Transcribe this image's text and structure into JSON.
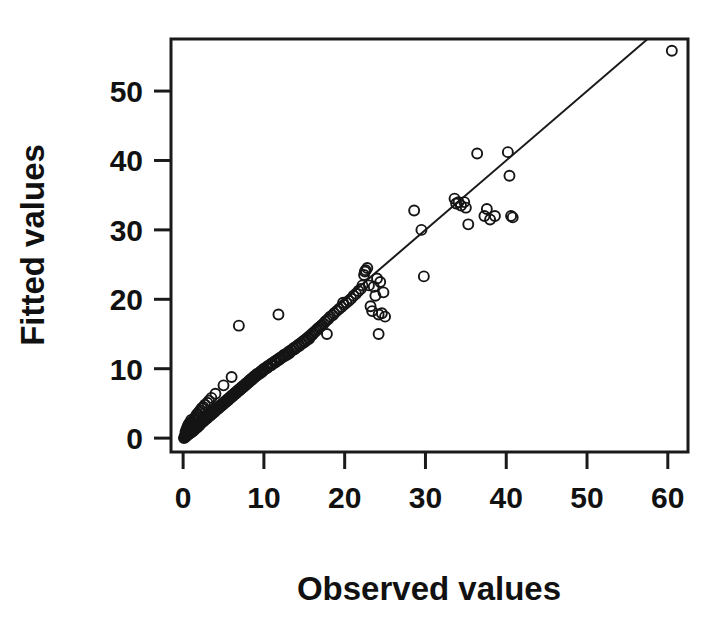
{
  "figure": {
    "background_color": "#ffffff",
    "foreground_color": "#1a1a1a"
  },
  "chart_data": {
    "type": "scatter",
    "title": "",
    "xlabel": "Observed values",
    "ylabel": "Fitted values",
    "xlim": [
      -1.5,
      62.5
    ],
    "ylim": [
      -2.0,
      57.5
    ],
    "xticks": [
      0,
      10,
      20,
      30,
      40,
      50,
      60
    ],
    "yticks": [
      0,
      10,
      20,
      30,
      40,
      50
    ],
    "xticklabels": [
      "0",
      "10",
      "20",
      "30",
      "40",
      "50",
      "60"
    ],
    "yticklabels": [
      "0",
      "10",
      "20",
      "30",
      "40",
      "50"
    ],
    "grid": false,
    "legend": null,
    "marker": {
      "shape": "open-circle",
      "radius_px": 5,
      "stroke": "#151515",
      "stroke_width": 1.9,
      "fill": "none"
    },
    "reference_line": {
      "label": "1:1 identity line",
      "type": "line",
      "slope": 1.0,
      "intercept": 0.0,
      "x_from": 0.0,
      "x_to": 57.5,
      "stroke": "#1a1a1a",
      "stroke_width": 2
    },
    "series": [
      {
        "name": "Observed vs fitted",
        "n_points": 243,
        "x": [
          0.1,
          0.2,
          0.2,
          0.3,
          0.3,
          0.3,
          0.4,
          0.4,
          0.4,
          0.5,
          0.5,
          0.5,
          0.6,
          0.6,
          0.6,
          0.7,
          0.7,
          0.7,
          0.8,
          0.8,
          0.8,
          0.9,
          0.9,
          1.0,
          1.0,
          1.0,
          1.1,
          1.1,
          1.2,
          1.2,
          1.3,
          1.3,
          1.4,
          1.4,
          1.5,
          1.5,
          1.6,
          1.6,
          1.7,
          1.7,
          1.8,
          1.8,
          1.9,
          2.0,
          2.0,
          2.1,
          2.1,
          2.2,
          2.3,
          2.3,
          2.4,
          2.5,
          2.5,
          2.6,
          2.7,
          2.7,
          2.8,
          2.9,
          3.0,
          3.0,
          3.1,
          3.2,
          3.2,
          3.3,
          3.4,
          3.5,
          3.5,
          3.6,
          3.7,
          3.8,
          3.9,
          4.0,
          4.0,
          4.1,
          4.2,
          4.3,
          4.4,
          4.5,
          4.6,
          4.7,
          4.8,
          4.9,
          5.0,
          5.0,
          5.1,
          5.2,
          5.3,
          5.4,
          5.5,
          5.6,
          5.7,
          5.8,
          5.9,
          6.0,
          6.0,
          6.1,
          6.2,
          6.3,
          6.4,
          6.5,
          6.6,
          6.7,
          6.8,
          6.9,
          7.0,
          7.1,
          7.2,
          7.3,
          7.4,
          7.5,
          7.6,
          7.7,
          7.8,
          7.9,
          8.0,
          8.1,
          8.2,
          8.3,
          8.4,
          8.5,
          8.6,
          8.7,
          8.8,
          8.9,
          9.0,
          9.1,
          9.2,
          9.4,
          9.5,
          9.6,
          9.7,
          9.8,
          9.9,
          10.0,
          10.1,
          10.3,
          10.4,
          10.5,
          10.6,
          10.8,
          10.9,
          11.0,
          11.1,
          11.3,
          11.4,
          11.5,
          11.6,
          11.8,
          11.9,
          12.0,
          12.1,
          12.3,
          12.4,
          12.5,
          12.7,
          12.8,
          13.0,
          13.1,
          13.2,
          13.4,
          13.5,
          13.7,
          13.8,
          14.0,
          14.1,
          14.3,
          14.4,
          14.6,
          14.7,
          14.9,
          15.0,
          15.2,
          15.3,
          15.5,
          15.6,
          15.8,
          16.0,
          16.1,
          16.3,
          16.5,
          16.6,
          16.8,
          17.0,
          17.2,
          17.4,
          17.6,
          17.8,
          18.0,
          18.2,
          18.5,
          18.7,
          19.0,
          19.3,
          19.6,
          19.9,
          20.2,
          20.5,
          20.8,
          21.1,
          21.4,
          21.7,
          22.0,
          22.2,
          22.4,
          22.6,
          22.8,
          23.0,
          23.2,
          23.4,
          23.6,
          23.8,
          24.0,
          24.2,
          24.4,
          24.6,
          24.8,
          25.0,
          6.9,
          11.8,
          17.8,
          19.8,
          22.5,
          24.2,
          28.6,
          29.5,
          29.8,
          33.6,
          33.8,
          34.1,
          34.4,
          34.8,
          35.0,
          35.3,
          36.4,
          37.3,
          37.6,
          38.0,
          38.6,
          40.2,
          40.4,
          40.6,
          40.8,
          60.5
        ],
        "y": [
          0.0,
          0.1,
          0.3,
          0.2,
          0.5,
          0.9,
          0.3,
          0.7,
          1.2,
          0.4,
          0.9,
          1.5,
          0.5,
          1.0,
          1.8,
          0.6,
          1.2,
          2.0,
          0.7,
          1.4,
          2.2,
          0.9,
          1.7,
          0.8,
          1.6,
          2.6,
          1.1,
          2.1,
          1.0,
          2.3,
          1.3,
          2.6,
          1.2,
          2.8,
          1.5,
          3.0,
          1.4,
          3.2,
          1.7,
          3.4,
          1.6,
          3.5,
          2.0,
          1.8,
          3.8,
          2.2,
          4.0,
          2.1,
          2.4,
          4.3,
          2.3,
          2.6,
          4.5,
          2.5,
          2.8,
          4.8,
          2.7,
          3.0,
          2.9,
          5.1,
          3.2,
          3.1,
          5.4,
          3.4,
          3.3,
          3.6,
          5.8,
          3.5,
          3.8,
          3.7,
          4.0,
          3.9,
          6.4,
          4.2,
          4.1,
          4.4,
          4.3,
          4.6,
          4.5,
          4.8,
          4.7,
          5.0,
          4.9,
          7.6,
          5.2,
          5.1,
          5.4,
          5.3,
          5.6,
          5.5,
          5.8,
          5.7,
          6.0,
          5.9,
          8.8,
          6.2,
          6.1,
          6.4,
          6.3,
          6.6,
          6.5,
          6.8,
          6.7,
          7.0,
          6.9,
          7.2,
          7.1,
          7.4,
          7.3,
          7.6,
          7.5,
          7.8,
          7.7,
          8.0,
          7.9,
          8.2,
          8.1,
          8.4,
          8.3,
          8.6,
          8.5,
          8.8,
          8.7,
          9.0,
          8.9,
          9.2,
          9.1,
          9.4,
          9.3,
          9.6,
          9.5,
          9.8,
          9.7,
          10.0,
          9.9,
          10.2,
          10.1,
          10.4,
          10.3,
          10.6,
          10.5,
          10.8,
          10.7,
          11.0,
          10.9,
          11.2,
          11.1,
          11.4,
          11.3,
          11.6,
          11.5,
          11.8,
          11.7,
          12.0,
          11.9,
          12.2,
          12.1,
          12.5,
          12.3,
          12.7,
          12.6,
          13.0,
          12.8,
          13.2,
          13.1,
          13.5,
          13.3,
          13.7,
          13.6,
          14.0,
          13.8,
          14.2,
          14.1,
          14.5,
          14.3,
          14.7,
          14.9,
          15.1,
          15.3,
          15.5,
          15.7,
          15.9,
          16.1,
          16.3,
          16.5,
          16.8,
          17.0,
          17.2,
          17.5,
          17.7,
          18.0,
          18.3,
          18.6,
          18.9,
          19.2,
          19.5,
          19.8,
          20.1,
          20.5,
          20.8,
          21.2,
          21.5,
          22.0,
          23.5,
          24.2,
          24.5,
          22.0,
          19.0,
          18.3,
          21.8,
          20.5,
          23.0,
          17.8,
          22.5,
          18.0,
          21.0,
          17.5,
          16.2,
          17.8,
          15.0,
          19.5,
          24.0,
          15.0,
          32.8,
          30.0,
          23.3,
          34.5,
          33.8,
          34.0,
          33.5,
          34.0,
          33.2,
          30.8,
          41.0,
          32.0,
          33.0,
          31.5,
          32.0,
          41.2,
          37.8,
          32.0,
          31.8,
          55.8
        ]
      }
    ]
  },
  "axis_titles": {
    "x": "Observed values",
    "y": "Fitted values"
  }
}
